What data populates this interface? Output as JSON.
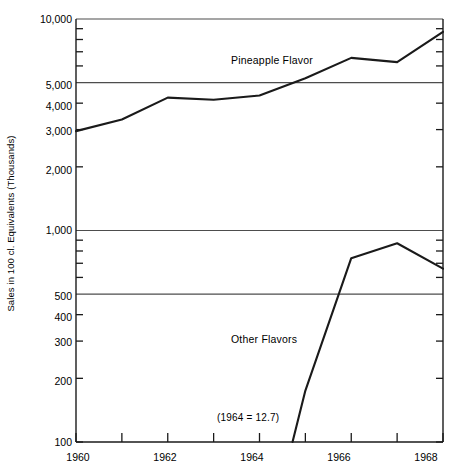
{
  "chart_data": {
    "type": "line",
    "title": "",
    "subtitle": "",
    "xlabel": "",
    "ylabel": "Sales in 100 cl. Equivalents (Thousands)",
    "yscale": "log",
    "ylim": [
      100,
      10000
    ],
    "xlim": [
      1960,
      1968
    ],
    "grid": true,
    "grid_lines": [
      500,
      1000,
      5000,
      10000
    ],
    "legend_position": "inline-annotations",
    "y_ticks_labeled": [
      "10,000",
      "5,000",
      "4,000",
      "3,000",
      "2,000",
      "1,000",
      "500",
      "400",
      "300",
      "200",
      "100"
    ],
    "y_tick_values": [
      10000,
      5000,
      4000,
      3000,
      2000,
      1000,
      500,
      400,
      300,
      200,
      100
    ],
    "y_ticks_minor": [
      9000,
      8000,
      7000,
      6000,
      900,
      800,
      700,
      600
    ],
    "x_ticks": [
      1960,
      1961,
      1962,
      1963,
      1964,
      1965,
      1966,
      1967,
      1968
    ],
    "x_ticks_labeled": [
      "1960",
      "1962",
      "1964",
      "1966",
      "1968"
    ],
    "x_tick_label_values": [
      1960,
      1962,
      1964,
      1966,
      1968
    ],
    "annotations": [
      {
        "text": "(1964 =  12.7)",
        "x": 1964.45,
        "y": 127
      }
    ],
    "series": [
      {
        "name": "Pineapple Flavor",
        "label_x": 1963.0,
        "label_y": 6300,
        "x": [
          1960,
          1961,
          1962,
          1963,
          1964,
          1965,
          1966,
          1967,
          1968
        ],
        "values": [
          2950,
          3350,
          4250,
          4150,
          4350,
          5250,
          6550,
          6250,
          8700
        ]
      },
      {
        "name": "Other Flavors",
        "label_x": 1963.0,
        "label_y": 300,
        "x": [
          1964.72,
          1965,
          1966,
          1967,
          1968
        ],
        "values": [
          100,
          175,
          740,
          870,
          660
        ]
      }
    ]
  },
  "figure": {
    "background_color": "#ffffff",
    "line_color": "#1a1a1a",
    "axis_color": "#1a1a1a",
    "grid_color": "#4d4d4d"
  }
}
